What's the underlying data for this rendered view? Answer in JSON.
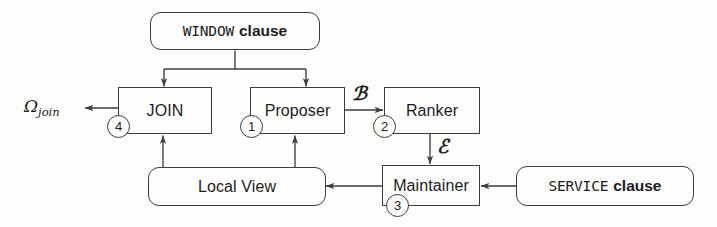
{
  "diagram": {
    "stroke_color": "#3c3c3c",
    "text_color": "#1c1c1c",
    "background_color": "#fdfdfc",
    "nodes": {
      "window_clause": {
        "keyword": "WINDOW",
        "word": "clause",
        "shape": "rounded-rectangle"
      },
      "join": {
        "label": "JOIN",
        "badge": "4",
        "shape": "rectangle"
      },
      "proposer": {
        "label": "Proposer",
        "badge": "1",
        "shape": "rectangle"
      },
      "ranker": {
        "label": "Ranker",
        "badge": "2",
        "shape": "rectangle"
      },
      "maintainer": {
        "label": "Maintainer",
        "badge": "3",
        "shape": "rectangle"
      },
      "local_view": {
        "label": "Local View",
        "shape": "rounded-rectangle"
      },
      "service_clause": {
        "keyword": "SERVICE",
        "word": "clause",
        "shape": "rounded-rectangle"
      }
    },
    "edge_labels": {
      "proposer_to_ranker": "ℬ",
      "ranker_to_maintainer": "ℰ"
    },
    "output": {
      "symbol": "Ω",
      "subscript": "join"
    }
  }
}
